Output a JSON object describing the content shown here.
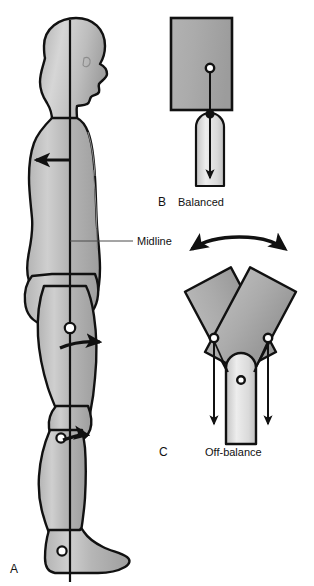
{
  "figure": {
    "background_color": "#ffffff",
    "outline_color": "#111111",
    "body_fill_light": "#d2d2d2",
    "body_fill_mid": "#a9a9a9",
    "block_fill": "#a8a8a8",
    "post_fill": "#e8e8e8",
    "leader_color": "#4a4a4a"
  },
  "panels": [
    {
      "id": "A",
      "letter": "A",
      "caption": "",
      "description": "Lateral view of standing human body with vertical midline through head, trunk, hip, knee and ankle",
      "annotations": [
        {
          "name": "midline-label",
          "text": "Midline"
        }
      ],
      "joints": [
        {
          "name": "hip-joint",
          "label": "hip"
        },
        {
          "name": "knee-joint",
          "label": "knee"
        },
        {
          "name": "ankle-joint",
          "label": "ankle"
        }
      ],
      "arrows": [
        {
          "name": "trunk-arrow",
          "direction": "left"
        },
        {
          "name": "hip-arrow",
          "direction": "right"
        },
        {
          "name": "knee-arrow",
          "direction": "right"
        }
      ]
    },
    {
      "id": "B",
      "letter": "B",
      "caption": "Balanced",
      "description": "Rectangular mass centered on a rounded support post with gravity line passing through both centers",
      "arrows": [
        {
          "name": "gravity-arrow",
          "direction": "down"
        }
      ],
      "pivots": [
        {
          "name": "mass-center-dot"
        },
        {
          "name": "support-center-dot"
        }
      ]
    },
    {
      "id": "C",
      "letter": "C",
      "caption": "Off-balance",
      "description": "Two tilted masses on a support post, each gravity line falling outside the base of support",
      "arrows": [
        {
          "name": "sway-arrow-double-headed",
          "direction": "bidirectional-curved"
        },
        {
          "name": "gravity-arrow-left",
          "direction": "down"
        },
        {
          "name": "gravity-arrow-right",
          "direction": "down"
        }
      ],
      "pivots": [
        {
          "name": "mass-center-dot-left"
        },
        {
          "name": "mass-center-dot-right"
        },
        {
          "name": "support-center-dot"
        }
      ]
    }
  ],
  "labels": {
    "midline": "Midline",
    "balanced": "Balanced",
    "off_balance": "Off-balance",
    "letter_a": "A",
    "letter_b": "B",
    "letter_c": "C"
  }
}
